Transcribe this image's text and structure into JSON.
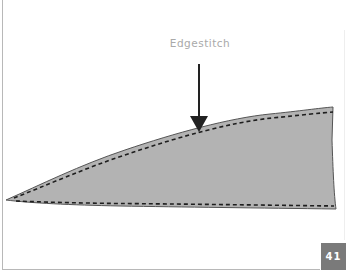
{
  "diagram": {
    "label": "Edgestitch",
    "page_number": "41",
    "colors": {
      "fabric_fill": "#b3b3b3",
      "outline": "#555555",
      "stitch": "#1e1e1e",
      "arrow": "#222222",
      "label_text": "#a9a9a9",
      "badge_bg": "#7a7a7a"
    },
    "icons": {
      "arrow": "down-arrow-icon"
    }
  }
}
